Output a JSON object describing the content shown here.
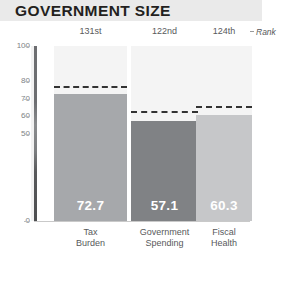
{
  "header": {
    "title": "GOVERNMENT SIZE"
  },
  "legend": {
    "rank_label": "Rank"
  },
  "chart_data": {
    "type": "bar",
    "title": "GOVERNMENT SIZE",
    "xlabel": "",
    "ylabel": "",
    "ylim": [
      0,
      100
    ],
    "grid": false,
    "legend_position": "top-right",
    "y_ticks": [
      100,
      80,
      70,
      60,
      50,
      0
    ],
    "y_tick_labels": [
      "100",
      "80",
      "70",
      "60",
      "50",
      "0"
    ],
    "categories": [
      "Tax Burden",
      "Government Spending",
      "Fiscal Health"
    ],
    "category_lines": [
      [
        "Tax",
        "Burden"
      ],
      [
        "Government",
        "Spending"
      ],
      [
        "Fiscal",
        "Health"
      ]
    ],
    "values": [
      72.7,
      57.1,
      60.3
    ],
    "value_labels": [
      "72.7",
      "57.1",
      "60.3"
    ],
    "ranks": [
      "131st",
      "122nd",
      "124th"
    ],
    "reference_lines": {
      "name": "World Average",
      "values": [
        77.0,
        62.6,
        66.0
      ],
      "style": "dashed"
    },
    "bar_colors": [
      "#a6a8ab",
      "#808285",
      "#c6c7c9"
    ],
    "column_background_color": "#f4f4f4",
    "title_background_color": "#eaeaea"
  }
}
